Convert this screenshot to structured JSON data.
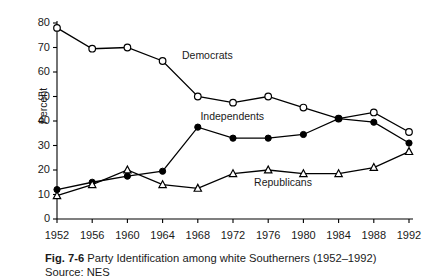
{
  "chart_data": {
    "type": "line",
    "title": "Party Identification among white Southerners (1952–1992)",
    "figure_number": "Fig. 7-6",
    "source": "Source: NES",
    "xlabel": "",
    "ylabel": "Percent",
    "categories": [
      1952,
      1956,
      1960,
      1964,
      1968,
      1972,
      1976,
      1980,
      1984,
      1988,
      1992
    ],
    "xtick_labels": [
      "1952",
      "1956",
      "1960",
      "1964",
      "1968",
      "1972",
      "1976",
      "1980",
      "1984",
      "1988",
      "1992"
    ],
    "ytick_labels": [
      "0",
      "10",
      "20",
      "30",
      "40",
      "50",
      "60",
      "70",
      "80"
    ],
    "yticks": [
      0,
      10,
      20,
      30,
      40,
      50,
      60,
      70,
      80
    ],
    "ylim": [
      0,
      80
    ],
    "xlim": [
      1952,
      1992
    ],
    "grid": false,
    "legend_position": "inline-annotations",
    "series": [
      {
        "name": "Democrats",
        "marker": "open-circle",
        "color": "#000000",
        "label_x": 1966.2,
        "label_y": 66.5,
        "values": [
          78,
          69.5,
          70,
          64.5,
          50,
          47.5,
          50,
          45.5,
          41,
          43.5,
          35.5
        ]
      },
      {
        "name": "Independents",
        "marker": "filled-circle",
        "color": "#000000",
        "label_x": 1968.3,
        "label_y": 41.5,
        "values": [
          12,
          15,
          17.5,
          19.5,
          37.5,
          33,
          33,
          34.5,
          41,
          39.5,
          31
        ]
      },
      {
        "name": "Republicans",
        "marker": "open-triangle",
        "color": "#000000",
        "label_x": 1974.4,
        "label_y": 14.5,
        "values": [
          9.5,
          14,
          20,
          14,
          12.5,
          18.5,
          20,
          18.5,
          18.5,
          21,
          27.5
        ]
      }
    ]
  }
}
